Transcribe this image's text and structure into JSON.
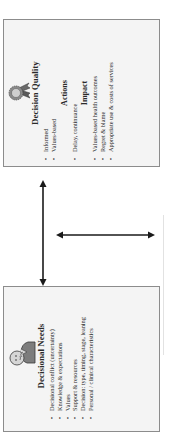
{
  "diagram": {
    "decisional_needs": {
      "title": "Decisional Needs",
      "icon": "thinking-person-icon",
      "items": [
        "Decisional conflict (uncertainty)",
        "Knowledge & expectations",
        "Values",
        "Support & resources",
        "Decision: type, timing, stage, leaning",
        "Personal / clinical characteristics"
      ]
    },
    "decision_quality": {
      "title": "Decision Quality",
      "icon": "award-ribbon-icon",
      "quality_items": [
        "Informed",
        "Values-based"
      ],
      "actions_title": "Actions",
      "actions_items": [
        "Delay, continuance"
      ],
      "impact_title": "Impact",
      "impact_items": [
        "Values-based health outcomes",
        "Regret & blame",
        "Appropriate use & costs of services"
      ]
    },
    "connectors": [
      {
        "type": "double-arrow",
        "between": "Decisional Needs - Decision Quality"
      },
      {
        "type": "double-arrow",
        "orientation": "cross"
      }
    ],
    "colors": {
      "box_fill": "#f4f4f4",
      "box_border": "#8c8c8c",
      "arrow": "#1a1a1a"
    }
  }
}
